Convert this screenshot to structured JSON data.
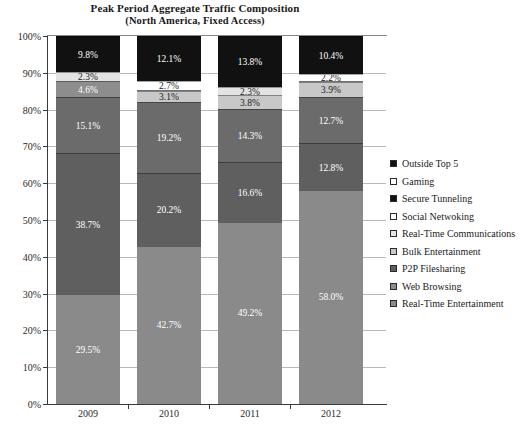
{
  "title": {
    "line1": "Peak Period Aggregate Traffic Composition",
    "line2": "(North America, Fixed Access)"
  },
  "caption": "",
  "legend": {
    "position": "right",
    "items": [
      {
        "label": "Outside Top 5",
        "swatch": "legend-swatch-outside-top-5",
        "color": "#111111"
      },
      {
        "label": "Gaming",
        "swatch": "legend-swatch-gaming",
        "color": "#ffffff"
      },
      {
        "label": "Secure Tunneling",
        "swatch": "legend-swatch-secure-tunneling",
        "color": "#111111"
      },
      {
        "label": "Social Netwoking",
        "swatch": "legend-swatch-social-netwoking",
        "color": "#ffffff"
      },
      {
        "label": "Real-Time Communications",
        "swatch": "legend-swatch-real-time-communications",
        "color": "#e3e3e3"
      },
      {
        "label": "Bulk Entertainment",
        "swatch": "legend-swatch-bulk-entertainment",
        "color": "#c8c8c8"
      },
      {
        "label": "P2P Filesharing",
        "swatch": "legend-swatch-p2p-filesharing",
        "color": "#5f5f5f"
      },
      {
        "label": "Web Browsing",
        "swatch": "legend-swatch-web-browsing",
        "color": "#8d8d8d"
      },
      {
        "label": "Real-Time Entertainment",
        "swatch": "legend-swatch-real-time-entertainment",
        "color": "#8a8a8a"
      }
    ]
  },
  "axes": {
    "y_ticks": [
      "0%",
      "10%",
      "20%",
      "30%",
      "40%",
      "50%",
      "60%",
      "70%",
      "80%",
      "90%",
      "100%"
    ],
    "x_ticks": [
      "2009",
      "2010",
      "2011",
      "2012"
    ]
  },
  "chart_data": {
    "type": "bar",
    "stacked": true,
    "title": "Peak Period Aggregate Traffic Composition (North America, Fixed Access)",
    "xlabel": "",
    "ylabel": "",
    "ylim": [
      0,
      100
    ],
    "yticks": [
      0,
      10,
      20,
      30,
      40,
      50,
      60,
      70,
      80,
      90,
      100
    ],
    "ytick_labels": [
      "0%",
      "10%",
      "20%",
      "30%",
      "40%",
      "50%",
      "60%",
      "70%",
      "80%",
      "90%",
      "100%"
    ],
    "grid": true,
    "legend_position": "right",
    "categories": [
      "2009",
      "2010",
      "2011",
      "2012"
    ],
    "series": [
      {
        "name": "Real-Time Entertainment",
        "values": [
          29.5,
          42.7,
          49.2,
          58.0
        ],
        "labels": [
          "29.5%",
          "42.7%",
          "49.2%",
          "58.0%"
        ],
        "color": "#8a8a8a"
      },
      {
        "name": "Web Browsing",
        "values": [
          0.0,
          0.0,
          0.0,
          12.8
        ],
        "labels": [
          "",
          "",
          "",
          "12.8%"
        ],
        "color": "#8d8d8d"
      },
      {
        "name": "P2P Filesharing",
        "values": [
          38.7,
          20.2,
          16.6,
          0.0
        ],
        "labels": [
          "38.7%",
          "20.2%",
          "16.6%",
          ""
        ],
        "color": "#5f5f5f"
      },
      {
        "name": "Bulk Entertainment",
        "values": [
          15.1,
          19.2,
          14.3,
          12.7
        ],
        "labels": [
          "15.1%",
          "19.2%",
          "14.3%",
          "12.7%"
        ],
        "color": "#c8c8c8"
      },
      {
        "name": "Real-Time Communications",
        "values": [
          4.6,
          3.1,
          3.8,
          3.9
        ],
        "labels": [
          "4.6%",
          "3.1%",
          "3.8%",
          "3.9%"
        ],
        "color": "#e3e3e3"
      },
      {
        "name": "Social Netwoking",
        "values": [
          2.3,
          2.7,
          2.3,
          2.2
        ],
        "labels": [
          "2.3%",
          "2.7%",
          "2.3%",
          "2.2%"
        ],
        "color": "#ffffff"
      },
      {
        "name": "Outside Top 5",
        "values": [
          9.8,
          12.1,
          13.8,
          10.4
        ],
        "labels": [
          "9.8%",
          "12.1%",
          "13.8%",
          "10.4%"
        ],
        "color": "#111111"
      }
    ]
  },
  "bars": [
    {
      "year": "2009",
      "segments": [
        {
          "name": "real-time-entertainment",
          "value": 29.5,
          "label": "29.5%",
          "fill": "f-rte",
          "text": "light"
        },
        {
          "name": "p2p-filesharing",
          "value": 38.7,
          "label": "38.7%",
          "fill": "f-dark",
          "text": "light"
        },
        {
          "name": "bulk-entertainment",
          "value": 15.1,
          "label": "15.1%",
          "fill": "f-darker",
          "text": "light"
        },
        {
          "name": "real-time-communications",
          "value": 4.6,
          "label": "4.6%",
          "fill": "f-mid",
          "text": "light"
        },
        {
          "name": "social-netwoking",
          "value": 2.3,
          "label": "2.3%",
          "fill": "f-vlight",
          "text": "dark"
        },
        {
          "name": "outside-top-5",
          "value": 9.8,
          "label": "9.8%",
          "fill": "f-black",
          "text": "light"
        }
      ]
    },
    {
      "year": "2010",
      "segments": [
        {
          "name": "real-time-entertainment",
          "value": 42.7,
          "label": "42.7%",
          "fill": "f-rte",
          "text": "light"
        },
        {
          "name": "p2p-filesharing",
          "value": 20.2,
          "label": "20.2%",
          "fill": "f-dark",
          "text": "light"
        },
        {
          "name": "bulk-entertainment",
          "value": 19.2,
          "label": "19.2%",
          "fill": "f-darker",
          "text": "light"
        },
        {
          "name": "real-time-communications",
          "value": 3.1,
          "label": "3.1%",
          "fill": "f-light",
          "text": "dark"
        },
        {
          "name": "social-netwoking",
          "value": 2.7,
          "label": "2.7%",
          "fill": "f-white",
          "text": "dark"
        },
        {
          "name": "outside-top-5",
          "value": 12.1,
          "label": "12.1%",
          "fill": "f-black",
          "text": "light"
        }
      ]
    },
    {
      "year": "2011",
      "segments": [
        {
          "name": "real-time-entertainment",
          "value": 49.2,
          "label": "49.2%",
          "fill": "f-rte",
          "text": "light"
        },
        {
          "name": "p2p-filesharing",
          "value": 16.6,
          "label": "16.6%",
          "fill": "f-dark",
          "text": "light"
        },
        {
          "name": "bulk-entertainment",
          "value": 14.3,
          "label": "14.3%",
          "fill": "f-darker",
          "text": "light"
        },
        {
          "name": "real-time-communications",
          "value": 3.8,
          "label": "3.8%",
          "fill": "f-light",
          "text": "dark"
        },
        {
          "name": "social-netwoking",
          "value": 2.3,
          "label": "2.3%",
          "fill": "f-vlight",
          "text": "dark"
        },
        {
          "name": "outside-top-5",
          "value": 13.8,
          "label": "13.8%",
          "fill": "f-black",
          "text": "light"
        }
      ]
    },
    {
      "year": "2012",
      "segments": [
        {
          "name": "real-time-entertainment",
          "value": 58.0,
          "label": "58.0%",
          "fill": "f-rte",
          "text": "light"
        },
        {
          "name": "web-browsing",
          "value": 12.8,
          "label": "12.8%",
          "fill": "f-dark",
          "text": "light"
        },
        {
          "name": "bulk-entertainment",
          "value": 12.7,
          "label": "12.7%",
          "fill": "f-darker",
          "text": "light"
        },
        {
          "name": "real-time-communications",
          "value": 3.9,
          "label": "3.9%",
          "fill": "f-light",
          "text": "dark"
        },
        {
          "name": "social-netwoking",
          "value": 2.2,
          "label": "2.2%",
          "fill": "f-white",
          "text": "dark"
        },
        {
          "name": "outside-top-5",
          "value": 10.4,
          "label": "10.4%",
          "fill": "f-black",
          "text": "light"
        }
      ]
    }
  ]
}
